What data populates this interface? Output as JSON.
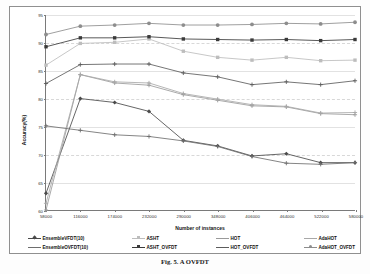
{
  "chart_data": {
    "type": "line",
    "title": "",
    "xlabel": "Number of instances",
    "ylabel": "Accuracy(%)",
    "xlim": [
      58000,
      580000
    ],
    "ylim": [
      60,
      95
    ],
    "yticks": [
      95,
      90,
      85,
      80,
      75,
      70,
      65,
      60
    ],
    "xticks": [
      58000,
      116000,
      174000,
      232000,
      290000,
      348000,
      406000,
      464000,
      522000,
      580000
    ],
    "x": [
      58000,
      116000,
      174000,
      232000,
      290000,
      348000,
      406000,
      464000,
      522000,
      580000
    ],
    "grid": true,
    "legend_position": "bottom",
    "series": [
      {
        "name": "EnsembleVFDT(10)",
        "color": "#4a4a4a",
        "marker": "diamond",
        "values": [
          63.0,
          80.0,
          79.3,
          77.7,
          72.5,
          71.5,
          69.7,
          70.1,
          68.5,
          68.5
        ]
      },
      {
        "name": "ASHT",
        "color": "#bdbdbd",
        "marker": "square",
        "values": [
          86.0,
          89.9,
          90.1,
          90.7,
          88.5,
          87.4,
          86.9,
          87.4,
          86.8,
          86.9
        ]
      },
      {
        "name": "HOT",
        "color": "#9a9a9a",
        "marker": "plus",
        "values": [
          60.0,
          84.3,
          82.8,
          82.4,
          80.7,
          79.7,
          78.7,
          78.5,
          77.3,
          77.1
        ]
      },
      {
        "name": "AdaHOT",
        "color": "#a8a8a8",
        "marker": "plus",
        "values": [
          61.2,
          84.3,
          83.0,
          82.8,
          80.9,
          79.9,
          78.9,
          78.6,
          77.4,
          77.5
        ]
      },
      {
        "name": "EnsembleOVFDT(10)",
        "color": "#6e6e6e",
        "marker": "plus",
        "values": [
          75.1,
          74.3,
          73.5,
          73.2,
          72.4,
          71.4,
          69.6,
          68.4,
          68.2,
          68.5
        ]
      },
      {
        "name": "ASHT_OVFDT",
        "color": "#3a3a3a",
        "marker": "square",
        "values": [
          89.3,
          90.9,
          90.9,
          91.1,
          90.7,
          90.6,
          90.5,
          90.6,
          90.4,
          90.6
        ]
      },
      {
        "name": "HOT_OVFDT",
        "color": "#5c5c5c",
        "marker": "plus",
        "values": [
          82.7,
          86.1,
          86.2,
          86.2,
          84.6,
          83.9,
          82.5,
          83.0,
          82.5,
          83.2
        ]
      },
      {
        "name": "AdaHOT_OVFDT",
        "color": "#8d8d8d",
        "marker": "circle",
        "values": [
          91.5,
          93.0,
          93.2,
          93.5,
          93.2,
          93.2,
          93.3,
          93.5,
          93.4,
          93.7
        ]
      }
    ]
  },
  "legend": {
    "rows": [
      [
        {
          "label": "EnsembleVFDT(10)",
          "series": 0
        },
        {
          "label": "ASHT",
          "series": 1
        },
        {
          "label": "HOT",
          "series": 2
        },
        {
          "label": "AdaHOT",
          "series": 3
        }
      ],
      [
        {
          "label": "EnsembleOVFDT(10)",
          "series": 4
        },
        {
          "label": "ASHT_OVFDT",
          "series": 5
        },
        {
          "label": "HOT_OVFDT",
          "series": 6
        },
        {
          "label": "AdaHOT_OVFDT",
          "series": 7
        }
      ]
    ]
  },
  "caption": "Fig. 5. A OVFDT"
}
